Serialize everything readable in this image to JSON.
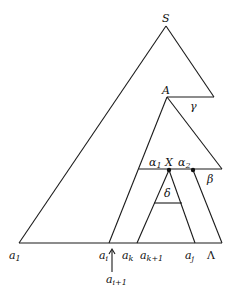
{
  "figure": {
    "type": "parse-tree diagram",
    "nodes": {
      "root": {
        "label": "S"
      },
      "subtree": {
        "label": "A"
      },
      "inner": {
        "label": "X"
      }
    },
    "segments": {
      "gamma": {
        "label": "γ"
      },
      "alpha1": {
        "label": "α",
        "sub": "1"
      },
      "alpha2": {
        "label": "α",
        "sub": "2"
      },
      "beta": {
        "label": "β"
      },
      "delta": {
        "label": "δ"
      }
    },
    "base_labels": [
      {
        "label": "a",
        "sub": "1"
      },
      {
        "label": "a",
        "sub": "i"
      },
      {
        "label": "a",
        "sub": "k"
      },
      {
        "label": "a",
        "sub": "k+1"
      },
      {
        "label": "a",
        "sub": "j"
      },
      {
        "label": "Λ"
      }
    ],
    "pointer": {
      "label": "a",
      "sub": "i+1",
      "arrow": "up-arrow"
    }
  }
}
